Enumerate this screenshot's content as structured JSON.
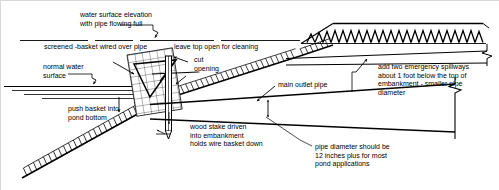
{
  "diagram": {
    "background_color": "#ffffff",
    "line_color": "#000000",
    "labels": {
      "water_surface_elevation": "water surface elevation\nwith pipe flowing full",
      "screened_basket": "screened -basket wired over pipe",
      "leave_top_open": "leave top open for cleaning",
      "cut_opening": "cut\nopening",
      "normal_water_surface": "normal water\nsurface",
      "push_basket": "push basket into\npond bottom",
      "wood_stake": "wood stake driven\ninto embankment\nholds wire basket down",
      "main_outlet_pipe": "main outlet pipe",
      "emergency_spillways": "add two emergency spillways\nabout 1 foot below the top of\nembankment - smaller pipe\ndiameter",
      "pipe_diameter": "pipe diameter should be\n12 inches plus for most\npond applications"
    },
    "elements": {
      "basket": "wire-mesh-basket",
      "stake": "wood-stake",
      "upper_embankment": "hatched-embankment-slope",
      "lower_embankment": "hatched-pond-bottom-slope",
      "top_berm": "chevron-hatched-berm",
      "pipe": "main-outlet-pipe",
      "break_symbol": "pipe-break-symbol"
    }
  }
}
